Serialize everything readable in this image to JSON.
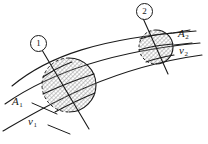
{
  "figure": {
    "kind": "stream-tube-diagram",
    "background_color": "#ffffff",
    "line_color": "#1a1a1a",
    "hatch_color": "#7a7a7a",
    "markers": [
      {
        "id": "1",
        "text": "①",
        "digit": "1"
      },
      {
        "id": "2",
        "text": "②",
        "digit": "2"
      }
    ],
    "labels": {
      "area_1": {
        "symbol": "A",
        "subscript": "1"
      },
      "speed_1": {
        "symbol": "v",
        "subscript": "1"
      },
      "area_2": {
        "symbol": "A",
        "subscript": "2"
      },
      "speed_2": {
        "symbol": "v",
        "subscript": "2"
      }
    },
    "cross_sections": [
      {
        "name": "section-1",
        "marker": "1",
        "center_x": 69,
        "center_y": 85,
        "radius_x": 27,
        "radius_y": 27,
        "hatched": true,
        "front_arc_dashed": true
      },
      {
        "name": "section-2",
        "marker": "2",
        "center_x": 156,
        "center_y": 47,
        "radius_x": 17,
        "radius_y": 17,
        "hatched": true,
        "front_arc_dashed": true
      }
    ]
  }
}
